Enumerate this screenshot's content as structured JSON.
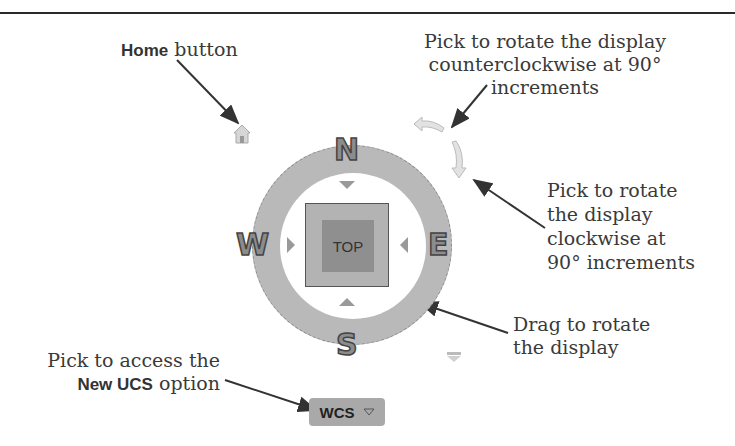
{
  "callouts": {
    "home": {
      "bold": "Home",
      "text": " button"
    },
    "ccw": {
      "line1": "Pick to rotate the display",
      "line2": "counterclockwise at 90° increments"
    },
    "cw": {
      "line1": "Pick to rotate",
      "line2": "the display",
      "line3": "clockwise at",
      "line4": "90° increments"
    },
    "drag": {
      "line1": "Drag to rotate",
      "line2": "the display"
    },
    "ucs": {
      "line1": "Pick to access the",
      "bold": "New UCS",
      "text": " option"
    }
  },
  "viewcube": {
    "face_label": "TOP",
    "compass": {
      "north": "N",
      "south": "S",
      "east": "E",
      "west": "W"
    },
    "ucs_menu": {
      "label": "WCS",
      "icon": "chevron-down-icon"
    }
  },
  "icons": {
    "home": "home-icon",
    "rotate_ccw": "rotate-ccw-icon",
    "rotate_cw": "rotate-cw-icon",
    "viewcube_menu": "viewcube-menu-icon"
  },
  "colors": {
    "ring": "#b9b9b9",
    "cube_outer": "#b3b3b3",
    "cube_inner": "#8f8f8f",
    "text": "#3a3a3a"
  }
}
